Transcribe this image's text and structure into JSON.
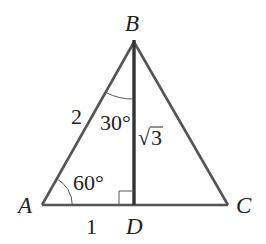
{
  "diagram": {
    "type": "triangle-with-altitude",
    "colors": {
      "stroke": "#555555",
      "altitude": "#333333",
      "text": "#222222",
      "background": "#ffffff"
    },
    "vertices": {
      "A": {
        "label": "A",
        "x": 42,
        "y": 205
      },
      "B": {
        "label": "B",
        "x": 134,
        "y": 42
      },
      "C": {
        "label": "C",
        "x": 228,
        "y": 205
      },
      "D": {
        "label": "D",
        "x": 134,
        "y": 205
      }
    },
    "labels": {
      "side_AB": "2",
      "side_AD": "1",
      "side_BD_radical": "√",
      "side_BD_value": "3",
      "angle_A": "60°",
      "angle_ABD": "30°"
    },
    "right_angle_at": "D"
  }
}
